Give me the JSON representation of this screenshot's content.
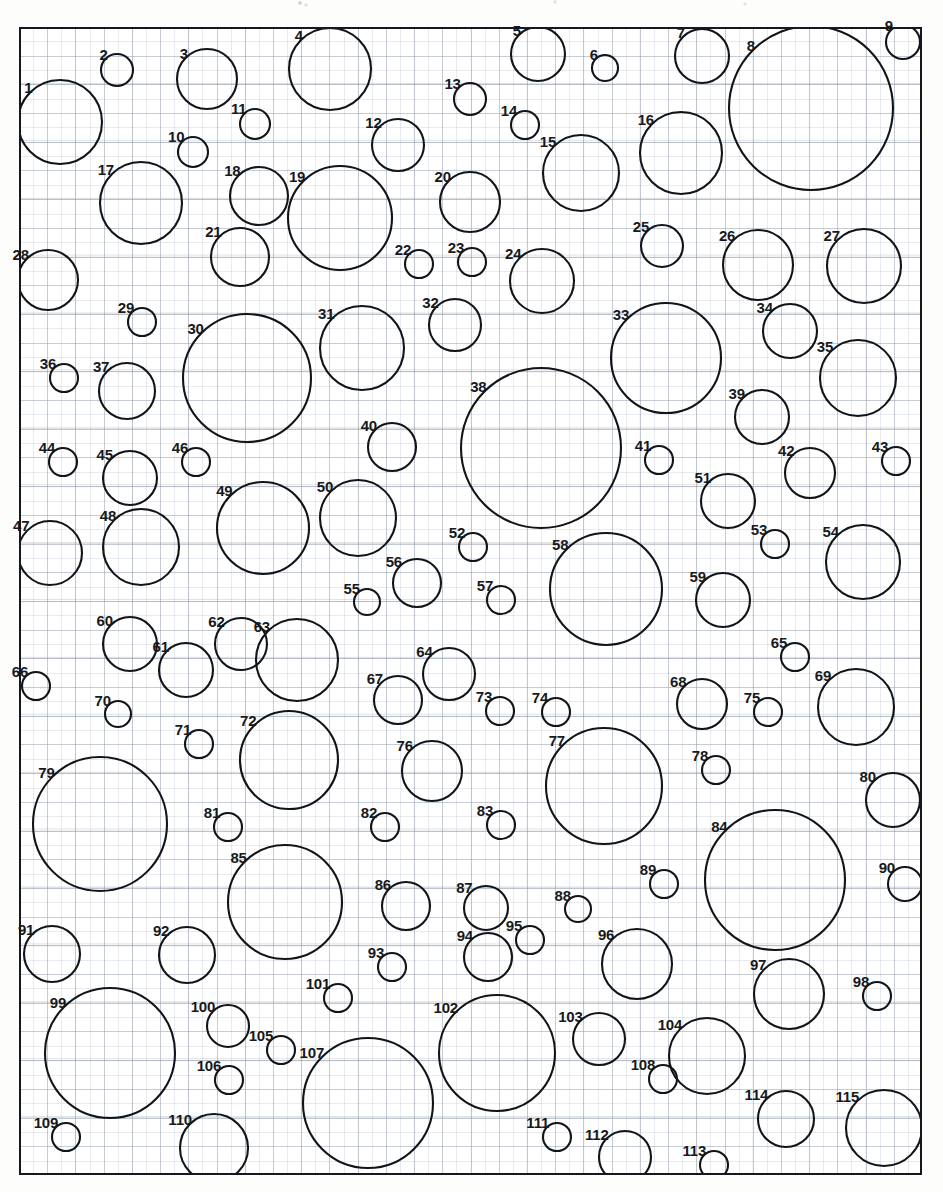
{
  "figure": {
    "type": "circle-packing-diagram",
    "sheet": {
      "x": 19,
      "y": 27,
      "width": 903,
      "height": 1148
    },
    "canvas": {
      "width": 943,
      "height": 1192
    },
    "grid": {
      "visible": true,
      "minor_spacing_px": 14.1,
      "major_spacing_px": 28.2,
      "minor_color": "#aab2bf",
      "major_color": "#96a0af",
      "paper_color": "#ffffff"
    },
    "stroke_color": "#111418",
    "stroke_width": 2.1,
    "label_color": "#16191d",
    "label_font_weight": "bold",
    "label_font_size_px": 15,
    "count": 115
  },
  "chart_data": {
    "type": "scatter",
    "title": "",
    "xlabel": "",
    "ylabel": "",
    "grid": true,
    "legend": null,
    "note": "Each point is a labelled circle: cx, cy in page pixels, r = radius in pixels. Labels are placed at the upper-left of each circle.",
    "circles": [
      {
        "id": 1,
        "label": "1",
        "cx": 60,
        "cy": 122,
        "r": 42
      },
      {
        "id": 2,
        "label": "2",
        "cx": 117,
        "cy": 70,
        "r": 16
      },
      {
        "id": 3,
        "label": "3",
        "cx": 207,
        "cy": 79,
        "r": 30
      },
      {
        "id": 4,
        "label": "4",
        "cx": 330,
        "cy": 69,
        "r": 41
      },
      {
        "id": 5,
        "label": "5",
        "cx": 538,
        "cy": 54,
        "r": 27
      },
      {
        "id": 6,
        "label": "6",
        "cx": 605,
        "cy": 68,
        "r": 13
      },
      {
        "id": 7,
        "label": "7",
        "cx": 702,
        "cy": 56,
        "r": 27
      },
      {
        "id": 8,
        "label": "8",
        "cx": 811,
        "cy": 108,
        "r": 82
      },
      {
        "id": 9,
        "label": "9",
        "cx": 903,
        "cy": 42,
        "r": 17
      },
      {
        "id": 10,
        "label": "10",
        "cx": 193,
        "cy": 152,
        "r": 15
      },
      {
        "id": 11,
        "label": "11",
        "cx": 255,
        "cy": 124,
        "r": 15
      },
      {
        "id": 12,
        "label": "12",
        "cx": 398,
        "cy": 145,
        "r": 26
      },
      {
        "id": 13,
        "label": "13",
        "cx": 470,
        "cy": 99,
        "r": 16
      },
      {
        "id": 14,
        "label": "14",
        "cx": 525,
        "cy": 125,
        "r": 14
      },
      {
        "id": 15,
        "label": "15",
        "cx": 581,
        "cy": 173,
        "r": 38
      },
      {
        "id": 16,
        "label": "16",
        "cx": 681,
        "cy": 153,
        "r": 41
      },
      {
        "id": 17,
        "label": "17",
        "cx": 141,
        "cy": 203,
        "r": 41
      },
      {
        "id": 18,
        "label": "18",
        "cx": 259,
        "cy": 196,
        "r": 29
      },
      {
        "id": 19,
        "label": "19",
        "cx": 340,
        "cy": 218,
        "r": 52
      },
      {
        "id": 20,
        "label": "20",
        "cx": 470,
        "cy": 202,
        "r": 30
      },
      {
        "id": 21,
        "label": "21",
        "cx": 240,
        "cy": 257,
        "r": 29
      },
      {
        "id": 22,
        "label": "22",
        "cx": 419,
        "cy": 264,
        "r": 14
      },
      {
        "id": 23,
        "label": "23",
        "cx": 472,
        "cy": 262,
        "r": 14
      },
      {
        "id": 24,
        "label": "24",
        "cx": 542,
        "cy": 281,
        "r": 32
      },
      {
        "id": 25,
        "label": "25",
        "cx": 662,
        "cy": 246,
        "r": 21
      },
      {
        "id": 26,
        "label": "26",
        "cx": 758,
        "cy": 265,
        "r": 35
      },
      {
        "id": 27,
        "label": "27",
        "cx": 864,
        "cy": 266,
        "r": 37
      },
      {
        "id": 28,
        "label": "28",
        "cx": 48,
        "cy": 280,
        "r": 30
      },
      {
        "id": 29,
        "label": "29",
        "cx": 142,
        "cy": 322,
        "r": 14
      },
      {
        "id": 30,
        "label": "30",
        "cx": 247,
        "cy": 378,
        "r": 64
      },
      {
        "id": 31,
        "label": "31",
        "cx": 362,
        "cy": 348,
        "r": 42
      },
      {
        "id": 32,
        "label": "32",
        "cx": 455,
        "cy": 325,
        "r": 26
      },
      {
        "id": 33,
        "label": "33",
        "cx": 666,
        "cy": 358,
        "r": 55
      },
      {
        "id": 34,
        "label": "34",
        "cx": 790,
        "cy": 331,
        "r": 27
      },
      {
        "id": 35,
        "label": "35",
        "cx": 858,
        "cy": 378,
        "r": 38
      },
      {
        "id": 36,
        "label": "36",
        "cx": 64,
        "cy": 378,
        "r": 14
      },
      {
        "id": 37,
        "label": "37",
        "cx": 127,
        "cy": 391,
        "r": 28
      },
      {
        "id": 38,
        "label": "38",
        "cx": 541,
        "cy": 448,
        "r": 80
      },
      {
        "id": 39,
        "label": "39",
        "cx": 762,
        "cy": 417,
        "r": 27
      },
      {
        "id": 40,
        "label": "40",
        "cx": 392,
        "cy": 447,
        "r": 24
      },
      {
        "id": 41,
        "label": "41",
        "cx": 659,
        "cy": 460,
        "r": 14
      },
      {
        "id": 42,
        "label": "42",
        "cx": 810,
        "cy": 473,
        "r": 25
      },
      {
        "id": 43,
        "label": "43",
        "cx": 896,
        "cy": 461,
        "r": 14
      },
      {
        "id": 44,
        "label": "44",
        "cx": 63,
        "cy": 462,
        "r": 14
      },
      {
        "id": 45,
        "label": "45",
        "cx": 130,
        "cy": 478,
        "r": 27
      },
      {
        "id": 46,
        "label": "46",
        "cx": 196,
        "cy": 462,
        "r": 14
      },
      {
        "id": 47,
        "label": "47",
        "cx": 50,
        "cy": 553,
        "r": 32
      },
      {
        "id": 48,
        "label": "48",
        "cx": 141,
        "cy": 547,
        "r": 38
      },
      {
        "id": 49,
        "label": "49",
        "cx": 263,
        "cy": 528,
        "r": 46
      },
      {
        "id": 50,
        "label": "50",
        "cx": 358,
        "cy": 518,
        "r": 38
      },
      {
        "id": 51,
        "label": "51",
        "cx": 728,
        "cy": 501,
        "r": 27
      },
      {
        "id": 52,
        "label": "52",
        "cx": 473,
        "cy": 547,
        "r": 14
      },
      {
        "id": 53,
        "label": "53",
        "cx": 775,
        "cy": 544,
        "r": 14
      },
      {
        "id": 54,
        "label": "54",
        "cx": 863,
        "cy": 562,
        "r": 37
      },
      {
        "id": 55,
        "label": "55",
        "cx": 367,
        "cy": 602,
        "r": 13
      },
      {
        "id": 56,
        "label": "56",
        "cx": 417,
        "cy": 583,
        "r": 24
      },
      {
        "id": 57,
        "label": "57",
        "cx": 501,
        "cy": 600,
        "r": 14
      },
      {
        "id": 58,
        "label": "58",
        "cx": 606,
        "cy": 589,
        "r": 56
      },
      {
        "id": 59,
        "label": "59",
        "cx": 723,
        "cy": 600,
        "r": 27
      },
      {
        "id": 60,
        "label": "60",
        "cx": 130,
        "cy": 644,
        "r": 27
      },
      {
        "id": 61,
        "label": "61",
        "cx": 186,
        "cy": 670,
        "r": 27
      },
      {
        "id": 62,
        "label": "62",
        "cx": 241,
        "cy": 644,
        "r": 26
      },
      {
        "id": 63,
        "label": "63",
        "cx": 297,
        "cy": 660,
        "r": 41
      },
      {
        "id": 64,
        "label": "64",
        "cx": 449,
        "cy": 674,
        "r": 26
      },
      {
        "id": 65,
        "label": "65",
        "cx": 795,
        "cy": 657,
        "r": 14
      },
      {
        "id": 66,
        "label": "66",
        "cx": 36,
        "cy": 686,
        "r": 14
      },
      {
        "id": 67,
        "label": "67",
        "cx": 398,
        "cy": 700,
        "r": 24
      },
      {
        "id": 68,
        "label": "68",
        "cx": 702,
        "cy": 704,
        "r": 25
      },
      {
        "id": 69,
        "label": "69",
        "cx": 856,
        "cy": 707,
        "r": 38
      },
      {
        "id": 70,
        "label": "70",
        "cx": 118,
        "cy": 714,
        "r": 13
      },
      {
        "id": 71,
        "label": "71",
        "cx": 199,
        "cy": 744,
        "r": 14
      },
      {
        "id": 72,
        "label": "72",
        "cx": 289,
        "cy": 760,
        "r": 49
      },
      {
        "id": 73,
        "label": "73",
        "cx": 500,
        "cy": 711,
        "r": 14
      },
      {
        "id": 74,
        "label": "74",
        "cx": 556,
        "cy": 712,
        "r": 14
      },
      {
        "id": 75,
        "label": "75",
        "cx": 768,
        "cy": 712,
        "r": 14
      },
      {
        "id": 76,
        "label": "76",
        "cx": 432,
        "cy": 771,
        "r": 30
      },
      {
        "id": 77,
        "label": "77",
        "cx": 604,
        "cy": 786,
        "r": 58
      },
      {
        "id": 78,
        "label": "78",
        "cx": 716,
        "cy": 770,
        "r": 14
      },
      {
        "id": 79,
        "label": "79",
        "cx": 100,
        "cy": 824,
        "r": 67
      },
      {
        "id": 80,
        "label": "80",
        "cx": 893,
        "cy": 800,
        "r": 27
      },
      {
        "id": 81,
        "label": "81",
        "cx": 228,
        "cy": 827,
        "r": 14
      },
      {
        "id": 82,
        "label": "82",
        "cx": 385,
        "cy": 827,
        "r": 14
      },
      {
        "id": 83,
        "label": "83",
        "cx": 501,
        "cy": 825,
        "r": 14
      },
      {
        "id": 84,
        "label": "84",
        "cx": 775,
        "cy": 880,
        "r": 70
      },
      {
        "id": 85,
        "label": "85",
        "cx": 285,
        "cy": 902,
        "r": 57
      },
      {
        "id": 86,
        "label": "86",
        "cx": 406,
        "cy": 906,
        "r": 24
      },
      {
        "id": 87,
        "label": "87",
        "cx": 486,
        "cy": 908,
        "r": 22
      },
      {
        "id": 88,
        "label": "88",
        "cx": 578,
        "cy": 909,
        "r": 13
      },
      {
        "id": 89,
        "label": "89",
        "cx": 664,
        "cy": 884,
        "r": 14
      },
      {
        "id": 90,
        "label": "90",
        "cx": 905,
        "cy": 884,
        "r": 17
      },
      {
        "id": 91,
        "label": "91",
        "cx": 52,
        "cy": 954,
        "r": 28
      },
      {
        "id": 92,
        "label": "92",
        "cx": 187,
        "cy": 955,
        "r": 28
      },
      {
        "id": 93,
        "label": "93",
        "cx": 392,
        "cy": 967,
        "r": 14
      },
      {
        "id": 94,
        "label": "94",
        "cx": 488,
        "cy": 957,
        "r": 24
      },
      {
        "id": 95,
        "label": "95",
        "cx": 530,
        "cy": 940,
        "r": 14
      },
      {
        "id": 96,
        "label": "96",
        "cx": 637,
        "cy": 964,
        "r": 35
      },
      {
        "id": 97,
        "label": "97",
        "cx": 789,
        "cy": 994,
        "r": 35
      },
      {
        "id": 98,
        "label": "98",
        "cx": 877,
        "cy": 996,
        "r": 14
      },
      {
        "id": 99,
        "label": "99",
        "cx": 110,
        "cy": 1053,
        "r": 65
      },
      {
        "id": 100,
        "label": "100",
        "cx": 228,
        "cy": 1026,
        "r": 21
      },
      {
        "id": 101,
        "label": "101",
        "cx": 338,
        "cy": 998,
        "r": 14
      },
      {
        "id": 102,
        "label": "102",
        "cx": 497,
        "cy": 1053,
        "r": 58
      },
      {
        "id": 103,
        "label": "103",
        "cx": 599,
        "cy": 1039,
        "r": 26
      },
      {
        "id": 104,
        "label": "104",
        "cx": 707,
        "cy": 1056,
        "r": 38
      },
      {
        "id": 105,
        "label": "105",
        "cx": 281,
        "cy": 1050,
        "r": 14
      },
      {
        "id": 106,
        "label": "106",
        "cx": 229,
        "cy": 1080,
        "r": 14
      },
      {
        "id": 107,
        "label": "107",
        "cx": 368,
        "cy": 1103,
        "r": 65
      },
      {
        "id": 108,
        "label": "108",
        "cx": 663,
        "cy": 1079,
        "r": 14
      },
      {
        "id": 109,
        "label": "109",
        "cx": 66,
        "cy": 1137,
        "r": 14
      },
      {
        "id": 110,
        "label": "110",
        "cx": 214,
        "cy": 1148,
        "r": 34
      },
      {
        "id": 111,
        "label": "111",
        "cx": 557,
        "cy": 1137,
        "r": 14
      },
      {
        "id": 112,
        "label": "112",
        "cx": 625,
        "cy": 1157,
        "r": 26
      },
      {
        "id": 113,
        "label": "113",
        "cx": 714,
        "cy": 1165,
        "r": 14
      },
      {
        "id": 114,
        "label": "114",
        "cx": 786,
        "cy": 1119,
        "r": 28
      },
      {
        "id": 115,
        "label": "115",
        "cx": 884,
        "cy": 1128,
        "r": 38
      }
    ]
  }
}
